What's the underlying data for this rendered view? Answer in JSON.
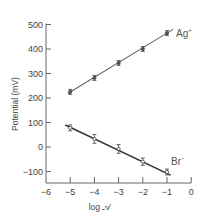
{
  "chart_data": {
    "type": "scatter",
    "title": "",
    "xlabel": "log 𝒜",
    "ylabel": "Potential (mV)",
    "xlim": [
      -6,
      0
    ],
    "ylim": [
      -130,
      510
    ],
    "x_ticks": [
      -6,
      -5,
      -4,
      -3,
      -2,
      -1,
      0
    ],
    "x_tick_labels": [
      "−6",
      "−5",
      "−4",
      "−3",
      "−2",
      "−1",
      "0"
    ],
    "y_ticks": [
      500,
      400,
      300,
      200,
      100,
      0,
      -100
    ],
    "y_tick_labels": [
      "500",
      "400",
      "300",
      "200",
      "100",
      "0",
      "−100"
    ],
    "grid": false,
    "legend": "inline labels at line ends",
    "series": [
      {
        "name": "Ag+",
        "label": "Ag",
        "label_sup": "+",
        "x": [
          -5,
          -4,
          -3,
          -2,
          -1
        ],
        "y": [
          225,
          282,
          343,
          400,
          465
        ],
        "error": [
          5,
          10,
          10,
          10,
          8
        ],
        "fit_line": {
          "x": [
            -5.1,
            -0.75
          ],
          "y": [
            218,
            480
          ]
        },
        "color": "#666666"
      },
      {
        "name": "Br-",
        "label": "Br",
        "label_sup": "−",
        "x": [
          -5,
          -4,
          -3,
          -2,
          -1
        ],
        "y": [
          78,
          33,
          -8,
          -60,
          -102
        ],
        "error": [
          12,
          18,
          18,
          15,
          12
        ],
        "fit_line": {
          "x": [
            -5.2,
            -0.85
          ],
          "y": [
            90,
            -115
          ]
        },
        "color": "#333333"
      }
    ]
  }
}
